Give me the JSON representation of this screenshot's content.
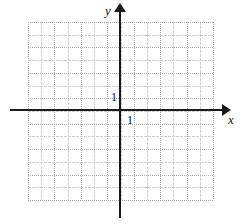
{
  "figure": {
    "kind": "cartesian-coordinate-grid",
    "background_color": "#ffffff",
    "axis_color": "#1a1a1a",
    "grid_color": "#adadad",
    "grid_major_color": "#cfcfcf"
  },
  "axes": {
    "x": {
      "label": "x",
      "tick_label": "1",
      "arrow": "arrow-right"
    },
    "y": {
      "label": "y",
      "tick_label": "1",
      "arrow": "arrow-up"
    }
  },
  "chart_data": {
    "type": "scatter",
    "title": "",
    "xlabel": "x",
    "ylabel": "y",
    "xlim": [
      -7.5,
      7.5
    ],
    "ylim": [
      -7.2,
      7.2
    ],
    "x": [],
    "y": [],
    "series": [],
    "grid": true,
    "grid_spacing": 1,
    "legend": "none",
    "annotations": [
      {
        "text": "1",
        "axis": "y",
        "value": 1
      },
      {
        "text": "1",
        "axis": "x",
        "value": 1
      }
    ],
    "xticks": [
      -7,
      -6,
      -5,
      -4,
      -3,
      -2,
      -1,
      0,
      1,
      2,
      3,
      4,
      5,
      6,
      7
    ],
    "yticks": [
      -7,
      -6,
      -5,
      -4,
      -3,
      -2,
      -1,
      0,
      1,
      2,
      3,
      4,
      5,
      6,
      7
    ],
    "xtick_labels": [
      "",
      "",
      "",
      "",
      "",
      "",
      "",
      "",
      "1",
      "",
      "",
      "",
      "",
      "",
      ""
    ],
    "ytick_labels": [
      "",
      "",
      "",
      "",
      "",
      "",
      "",
      "",
      "1",
      "",
      "",
      "",
      "",
      "",
      ""
    ]
  }
}
